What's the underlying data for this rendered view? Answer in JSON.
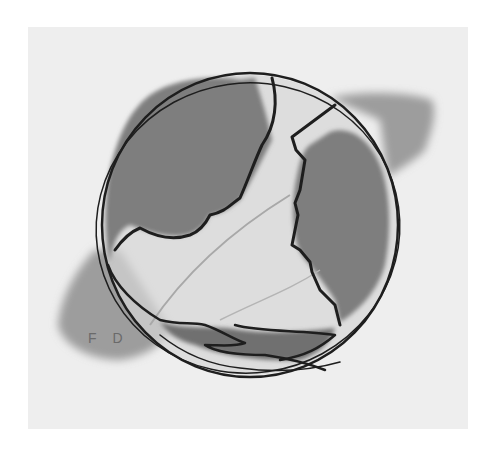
{
  "artwork": {
    "subject": "Two facing profile silhouettes forming a globe",
    "medium": "watercolor and ink",
    "signature": "F D",
    "colors": {
      "paper": "#eeeeee",
      "border": "#ffffff",
      "wash_dark": "#7a7a7a",
      "wash_mid": "#9a9a9a",
      "wash_light": "#c4c4c4",
      "ink": "#1e1e1e"
    }
  }
}
